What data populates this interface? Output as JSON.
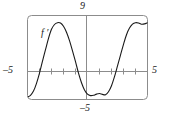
{
  "figure": {
    "kind": "graphing-calculator-plot",
    "curve_label": "f ′",
    "labels": {
      "y_max": "9",
      "y_min": "–5",
      "x_min": "–5",
      "x_max": "5"
    },
    "colors": {
      "curve": "#1a1a1a",
      "frame": "#8c8c8c",
      "axis": "#8c8c8c",
      "background": "#ffffff",
      "text": "#1a1a1a"
    }
  },
  "chart_data": {
    "type": "line",
    "title": "",
    "subtitle": "",
    "xlabel": "",
    "ylabel": "",
    "xlim": [
      -5,
      5
    ],
    "ylim": [
      -5,
      9
    ],
    "grid": false,
    "legend": "none",
    "annotations": [
      {
        "text": "f ′",
        "x": -3.6,
        "y": 5.2
      },
      {
        "text": "9",
        "x": 0.0,
        "y": 9.0
      },
      {
        "text": "–5",
        "x": 0.0,
        "y": -5.0
      },
      {
        "text": "–5",
        "x": -5.0,
        "y": 0.0
      },
      {
        "text": "5",
        "x": 5.0,
        "y": 0.0
      }
    ],
    "x_ticks": [
      -4,
      -3,
      -2,
      -1,
      1,
      2,
      3,
      4
    ],
    "y_ticks": [],
    "x_tick_labels": [
      "",
      "",
      "",
      "",
      "",
      "",
      "",
      ""
    ],
    "zero_crossings": [
      -4.1,
      -0.4,
      3.2
    ],
    "extrema": [
      {
        "type": "minimum",
        "x": -5.0,
        "y": -4.6
      },
      {
        "type": "maximum",
        "x": -2.3,
        "y": 7.8
      },
      {
        "type": "minimum",
        "x": 1.4,
        "y": -4.3
      },
      {
        "type": "maximum",
        "x": 4.9,
        "y": 7.8
      }
    ],
    "series": [
      {
        "name": "f ′",
        "x": [
          -5.0,
          -4.75,
          -4.5,
          -4.25,
          -4.0,
          -3.75,
          -3.5,
          -3.25,
          -3.0,
          -2.75,
          -2.5,
          -2.25,
          -2.0,
          -1.75,
          -1.5,
          -1.25,
          -1.0,
          -0.75,
          -0.5,
          -0.25,
          0.0,
          0.25,
          0.5,
          0.75,
          1.0,
          1.25,
          1.5,
          1.75,
          2.0,
          2.25,
          2.5,
          2.75,
          3.0,
          3.25,
          3.5,
          3.75,
          4.0,
          4.25,
          4.5,
          4.75,
          5.0
        ],
        "y": [
          -4.6,
          -4.3,
          -3.6,
          -2.3,
          -0.6,
          1.4,
          3.3,
          5.2,
          6.7,
          7.5,
          7.8,
          7.75,
          7.2,
          6.2,
          4.8,
          3.1,
          1.3,
          -0.6,
          -2.2,
          -3.4,
          -4.1,
          -4.35,
          -4.3,
          -4.1,
          -4.0,
          -4.15,
          -4.2,
          -3.7,
          -2.7,
          -1.2,
          0.6,
          2.4,
          4.2,
          5.8,
          6.9,
          7.55,
          7.8,
          7.75,
          7.55,
          7.6,
          7.8
        ]
      }
    ]
  }
}
